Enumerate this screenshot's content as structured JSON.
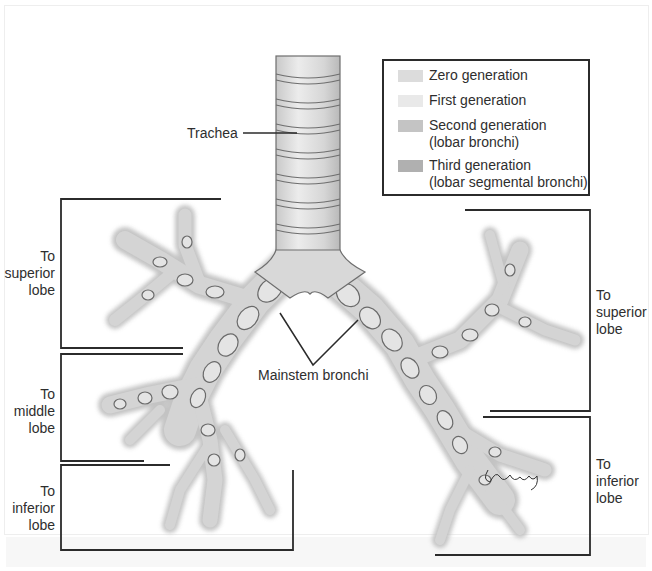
{
  "diagram": {
    "labels": {
      "trachea": "Trachea",
      "mainstem": "Mainstem bronchi",
      "left_superior": [
        "To",
        "superior",
        "lobe"
      ],
      "left_middle": [
        "To",
        "middle",
        "lobe"
      ],
      "left_inferior": [
        "To",
        "inferior",
        "lobe"
      ],
      "right_superior": [
        "To",
        "superior",
        "lobe"
      ],
      "right_inferior": [
        "To",
        "inferior",
        "lobe"
      ]
    },
    "legend": {
      "items": [
        {
          "line1": "Zero generation",
          "line2": "",
          "color": "#dcdcdc"
        },
        {
          "line1": "First generation",
          "line2": "",
          "color": "#e8e8e8"
        },
        {
          "line1": "Second generation",
          "line2": "(lobar bronchi)",
          "color": "#c4c4c4"
        },
        {
          "line1": "Third generation",
          "line2": "(lobar segmental bronchi)",
          "color": "#b0b0b0"
        }
      ]
    },
    "signature": "J Gregory",
    "colors": {
      "line": "#2b2b2b",
      "airway_fill": "#d9d9d9",
      "airway_outline": "#6e6e6e",
      "airway_shadow": "#b8b8b8"
    }
  }
}
